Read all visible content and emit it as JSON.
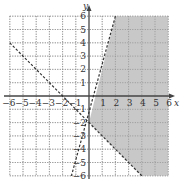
{
  "chart_data": {
    "type": "inequality-graph",
    "title": "",
    "xlabel": "x",
    "ylabel": "y",
    "xlim": [
      -6,
      6
    ],
    "ylim": [
      -6,
      6
    ],
    "grid": true,
    "grid_style": "dotted",
    "x_ticks": [
      "-6",
      "-5",
      "-4",
      "-3",
      "-2",
      "-1",
      "1",
      "2",
      "3",
      "4",
      "5",
      "6"
    ],
    "y_ticks": [
      "6",
      "5",
      "4",
      "3",
      "2",
      "1",
      "-1",
      "-2",
      "-3",
      "-4",
      "-5",
      "-6"
    ],
    "lines": [
      {
        "name": "boundary-1",
        "equation": "y = 3x - 2",
        "style": "dashed",
        "points": [
          [
            2,
            6
          ],
          [
            -1.333,
            -6
          ]
        ]
      },
      {
        "name": "boundary-2",
        "equation": "y = -x - 2",
        "style": "dashed",
        "points": [
          [
            -6,
            4
          ],
          [
            4,
            -6
          ]
        ]
      }
    ],
    "shaded_region": {
      "description": "y < 3x - 2 and y > -x - 2",
      "vertices": [
        [
          2,
          6
        ],
        [
          6,
          6
        ],
        [
          6,
          -6
        ],
        [
          4,
          -6
        ],
        [
          0,
          -2
        ]
      ],
      "color": "#c8c8c8"
    }
  }
}
